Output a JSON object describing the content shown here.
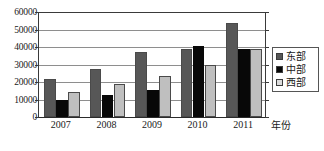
{
  "chart_data": {
    "type": "bar",
    "title": "",
    "xlabel": "年份",
    "ylabel": "",
    "categories": [
      "2007",
      "2008",
      "2009",
      "2010",
      "2011"
    ],
    "series": [
      {
        "name": "东部",
        "color": "#575757",
        "values": [
          21800,
          27200,
          37100,
          39000,
          54000
        ]
      },
      {
        "name": "中部",
        "color": "#080808",
        "values": [
          10000,
          12500,
          15500,
          40700,
          38700
        ]
      },
      {
        "name": "西部",
        "color": "#bfbfbf",
        "values": [
          14200,
          19100,
          23500,
          29500,
          38700
        ]
      }
    ],
    "ylim": [
      0,
      60000
    ],
    "ytick_labels": [
      "60000",
      "50000",
      "40000",
      "30000",
      "20000",
      "10000",
      "0"
    ],
    "ytick_values": [
      60000,
      50000,
      40000,
      30000,
      20000,
      10000,
      0
    ],
    "grid": true,
    "legend_position": "right",
    "legend_entries": [
      "东部",
      "中部",
      "西部"
    ]
  },
  "caption": ""
}
